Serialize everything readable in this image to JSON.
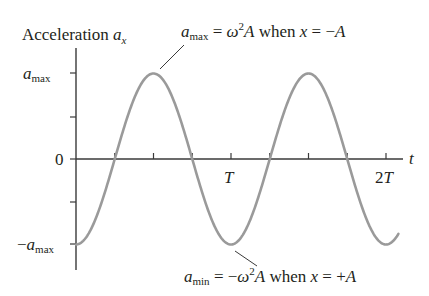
{
  "chart_data": {
    "type": "line",
    "ylabel": "Acceleration a_x",
    "xlabel": "t",
    "function": "a_x(t) = -a_max * cos(2*pi*t/T)",
    "x_ticks": [
      {
        "value": 0.25,
        "label": ""
      },
      {
        "value": 0.5,
        "label": ""
      },
      {
        "value": 0.75,
        "label": ""
      },
      {
        "value": 1.0,
        "label": "T"
      },
      {
        "value": 1.25,
        "label": ""
      },
      {
        "value": 1.5,
        "label": ""
      },
      {
        "value": 1.75,
        "label": ""
      },
      {
        "value": 2.0,
        "label": "2T"
      }
    ],
    "y_ticks": [
      {
        "value": 1.0,
        "label": "a_max"
      },
      {
        "value": 0.5,
        "label": ""
      },
      {
        "value": 0.0,
        "label": "0"
      },
      {
        "value": -0.5,
        "label": ""
      },
      {
        "value": -1.0,
        "label": "-a_max"
      }
    ],
    "x": [
      0,
      0.25,
      0.5,
      0.75,
      1.0,
      1.25,
      1.5,
      1.75,
      2.0,
      2.08
    ],
    "series": [
      {
        "name": "a_x",
        "values": [
          -1.0,
          0.0,
          1.0,
          0.0,
          -1.0,
          0.0,
          1.0,
          0.0,
          -1.0,
          -0.87
        ],
        "color": "#9a9a9a"
      }
    ],
    "xlim": [
      0,
      2.1
    ],
    "ylim": [
      -1.2,
      1.35
    ],
    "grid": false,
    "legend": "none",
    "annotations": [
      {
        "text": "a_max = ω²A when x = −A",
        "points_to": {
          "t": 0.5,
          "a": 1.0
        }
      },
      {
        "text": "a_min = −ω²A when x = +A",
        "points_to": {
          "t": 1.0,
          "a": -1.0
        }
      }
    ]
  },
  "labels": {
    "title_main": "Acceleration ",
    "title_var": "a",
    "title_sub": "x",
    "y_max_var": "a",
    "y_max_sub": "max",
    "y_zero": "0",
    "y_min_minus": "−",
    "y_min_var": "a",
    "y_min_sub": "max",
    "x_axis": "t",
    "tick_T": "T",
    "tick_2T_num": "2",
    "tick_2T_var": "T"
  },
  "annotations": {
    "top": {
      "var": "a",
      "sub": "max",
      "eq": " = ",
      "omega": "ω",
      "sq": "2",
      "A": "A",
      "when": " when ",
      "x": "x",
      "eq2": " = −",
      "rhs": "A"
    },
    "bottom": {
      "var": "a",
      "sub": "min",
      "eq": " = −",
      "omega": "ω",
      "sq": "2",
      "A": "A",
      "when": " when ",
      "x": "x",
      "eq2": " = +",
      "rhs": "A"
    }
  }
}
